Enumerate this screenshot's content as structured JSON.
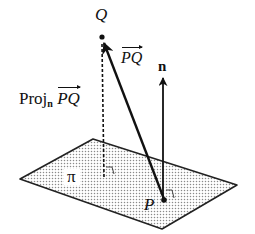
{
  "diagram": {
    "labels": {
      "point_q": "Q",
      "point_p": "P",
      "vector_pq": "PQ",
      "normal": "n",
      "plane": "π",
      "projection_prefix": "Proj",
      "projection_subscript": "n",
      "projection_vector": "PQ"
    },
    "elements": [
      {
        "id": "plane",
        "type": "parallelogram",
        "label": "π",
        "fill": "dotted-gray"
      },
      {
        "id": "vector_pq",
        "type": "arrow",
        "from": "P",
        "to": "Q",
        "label": "PQ (vector)"
      },
      {
        "id": "normal",
        "type": "arrow",
        "from": "P",
        "direction": "up",
        "label": "n"
      },
      {
        "id": "projection",
        "type": "dashed-line",
        "from": "Q",
        "to": "plane",
        "label": "Proj_n PQ",
        "right_angle_marker": true
      },
      {
        "id": "right_angle_p",
        "type": "right-angle-marker",
        "at": "P"
      }
    ],
    "colors": {
      "ink": "#111111",
      "plane_dots": "#9a9a9a",
      "background": "#ffffff"
    }
  }
}
